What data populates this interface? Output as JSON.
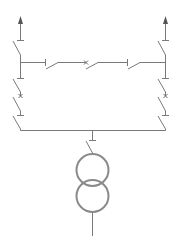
{
  "diagram": {
    "type": "single-line electrical diagram",
    "line_color": "#7a7a7a",
    "background": "#ffffff",
    "feeders": [
      {
        "id": "left-feeder",
        "outgoing_arrow": true,
        "devices": [
          "disconnector",
          "disconnector",
          "circuit-breaker",
          "disconnector"
        ]
      },
      {
        "id": "right-feeder",
        "outgoing_arrow": true,
        "devices": [
          "disconnector",
          "disconnector",
          "circuit-breaker",
          "disconnector"
        ]
      }
    ],
    "bus_tie": {
      "devices": [
        "disconnector",
        "circuit-breaker",
        "disconnector"
      ]
    },
    "transformer": {
      "type": "two-winding",
      "windings": 2,
      "connection": "disconnector"
    }
  }
}
